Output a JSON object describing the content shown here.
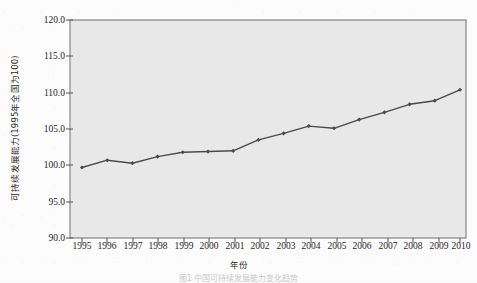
{
  "figure": {
    "background_color": "#fcfcfc",
    "plot_background_color": "#e8e8e8",
    "line_color": "#4a4a4a",
    "axis_color": "#6e6e6e",
    "caption": "图1  中国可持续发展能力变化趋势",
    "xlabel": "年份",
    "ylabel": "可持续发展能力(1995年全国为100)"
  },
  "chart_data": {
    "type": "line",
    "title": "",
    "xlabel": "年份",
    "ylabel": "可持续发展能力(1995年全国为100)",
    "x": [
      1995,
      1996,
      1997,
      1998,
      1999,
      2000,
      2001,
      2002,
      2003,
      2004,
      2005,
      2006,
      2007,
      2008,
      2009,
      2010
    ],
    "categories": [
      "1995",
      "1996",
      "1997",
      "1998",
      "1999",
      "2000",
      "2001",
      "2002",
      "2003",
      "2004",
      "2005",
      "2006",
      "2007",
      "2008",
      "2009",
      "2010"
    ],
    "values": [
      99.7,
      100.7,
      100.3,
      101.2,
      101.8,
      101.9,
      102.0,
      103.5,
      104.4,
      105.4,
      105.1,
      106.3,
      107.3,
      108.4,
      108.9,
      110.4
    ],
    "series": [
      {
        "name": "可持续发展能力",
        "values": [
          99.7,
          100.7,
          100.3,
          101.2,
          101.8,
          101.9,
          102.0,
          103.5,
          104.4,
          105.4,
          105.1,
          106.3,
          107.3,
          108.4,
          108.9,
          110.4
        ]
      }
    ],
    "xlim": [
      1994.5,
      2010.5
    ],
    "ylim": [
      90.0,
      120.0
    ],
    "yticks": [
      "90.0",
      "95.0",
      "100.0",
      "105.0",
      "110.0",
      "115.0",
      "120.0"
    ],
    "ytick_values": [
      90.0,
      95.0,
      100.0,
      105.0,
      110.0,
      115.0,
      120.0
    ],
    "xticks": [
      "1995",
      "1996",
      "1997",
      "1998",
      "1999",
      "2000",
      "2001",
      "2002",
      "2003",
      "2004",
      "2005",
      "2006",
      "2007",
      "2008",
      "2009",
      "2010"
    ],
    "grid": false,
    "legend": null,
    "marker": "diamond",
    "line_color": "#4a4a4a"
  }
}
